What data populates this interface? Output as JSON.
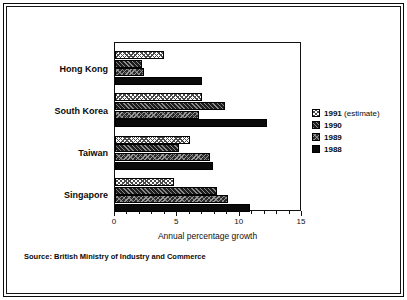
{
  "chart_data": {
    "type": "bar",
    "orientation": "horizontal",
    "title": "",
    "xlabel": "Annual percentage growth",
    "ylabel": "",
    "xlim": [
      0,
      15
    ],
    "xticks": [
      0,
      5,
      10,
      15
    ],
    "xtick_labels": [
      "0",
      "5",
      "10",
      "15"
    ],
    "grid": false,
    "legend_position": "right",
    "categories": [
      "Hong Kong",
      "South Korea",
      "Taiwan",
      "Singapore"
    ],
    "series": [
      {
        "name": "1991 (estimate)",
        "values": [
          3.9,
          7.0,
          6.0,
          4.7
        ]
      },
      {
        "name": "1990",
        "values": [
          2.2,
          8.8,
          5.1,
          8.2
        ]
      },
      {
        "name": "1989",
        "values": [
          2.3,
          6.7,
          7.6,
          9.1
        ]
      },
      {
        "name": "1988",
        "values": [
          7.0,
          12.2,
          7.9,
          10.8
        ]
      }
    ],
    "source": "Source:  British Ministry of Industry and Commerce"
  },
  "legend": {
    "items": [
      {
        "label": "1991 ",
        "suffix": "(estimate)"
      },
      {
        "label": "1990",
        "suffix": ""
      },
      {
        "label": "1989",
        "suffix": ""
      },
      {
        "label": "1988",
        "suffix": ""
      }
    ]
  }
}
